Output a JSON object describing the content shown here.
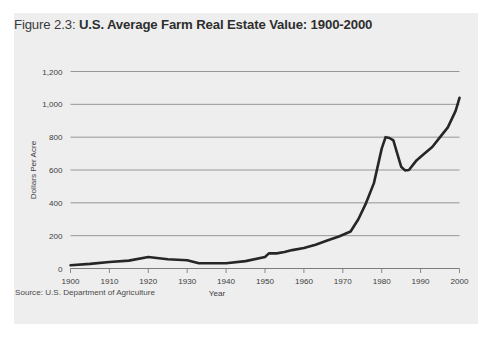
{
  "figure": {
    "title_prefix": "Figure 2.3: ",
    "title_main": "U.S. Average Farm Real Estate Value: 1900-2000",
    "source": "Source: U.S. Department of Agriculture",
    "panel_color": "#eeeeee",
    "line_color": "#262626",
    "grid_color": "#8c8c8c",
    "text_color": "#3d3d3d"
  },
  "chart_data": {
    "type": "line",
    "title": "Figure 2.3: U.S. Average Farm Real Estate Value: 1900-2000",
    "xlabel": "Year",
    "ylabel": "Dollars Per Acre",
    "xlim": [
      1900,
      2000
    ],
    "ylim": [
      0,
      1200
    ],
    "xticks": [
      1900,
      1910,
      1920,
      1930,
      1940,
      1950,
      1960,
      1970,
      1980,
      1990,
      2000
    ],
    "xtick_labels": [
      "1900",
      "1910",
      "1920",
      "1930",
      "1940",
      "1950",
      "1960",
      "1970",
      "1980",
      "1990",
      "2000"
    ],
    "yticks": [
      0,
      200,
      400,
      600,
      800,
      1000,
      1200
    ],
    "ytick_labels": [
      "0",
      "200",
      "400",
      "600",
      "800",
      "1,000",
      "1,200"
    ],
    "grid": "horizontal",
    "legend": "none",
    "series": [
      {
        "name": "U.S. Average Farm Real Estate Value",
        "x": [
          1900,
          1905,
          1910,
          1915,
          1920,
          1925,
          1930,
          1933,
          1936,
          1940,
          1945,
          1950,
          1951,
          1953,
          1955,
          1957,
          1960,
          1963,
          1966,
          1969,
          1972,
          1974,
          1976,
          1978,
          1980,
          1981,
          1982,
          1983,
          1984,
          1985,
          1986,
          1987,
          1989,
          1991,
          1993,
          1995,
          1997,
          1999,
          2000
        ],
        "values": [
          20,
          28,
          40,
          48,
          70,
          56,
          50,
          32,
          32,
          32,
          45,
          70,
          92,
          92,
          100,
          112,
          125,
          145,
          170,
          195,
          225,
          300,
          400,
          520,
          730,
          800,
          795,
          780,
          700,
          620,
          598,
          600,
          660,
          700,
          740,
          800,
          860,
          960,
          1040
        ]
      }
    ]
  }
}
